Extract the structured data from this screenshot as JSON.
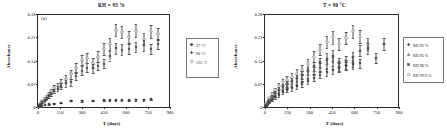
{
  "figure": {
    "panel_label": "(b)",
    "axis_x_label": "T (days)",
    "axis_y_label": "Absorbance"
  },
  "chart_data": [
    {
      "type": "scatter",
      "panel": "(b)",
      "title": "RH = 95 %",
      "xlabel": "T (days)",
      "ylabel": "Absorbance",
      "xlim": [
        0,
        900
      ],
      "ylim": [
        0,
        0.28
      ],
      "xticks": [
        0,
        150,
        300,
        450,
        600,
        750,
        900
      ],
      "yticks": [
        0,
        0.07,
        0.14,
        0.21,
        0.28
      ],
      "xtick_labels": [
        "0",
        "150",
        "300",
        "450",
        "600",
        "750",
        "900"
      ],
      "ytick_labels": [
        "0",
        "0.07",
        "0.14",
        "0.21",
        "0.28"
      ],
      "grid": false,
      "legend_position": "right-outside",
      "error_bars": true,
      "series": [
        {
          "name": "125 °C",
          "marker": "open-circle",
          "color": "#8d8d8d",
          "x": [
            7,
            15,
            22,
            30,
            45,
            60,
            75,
            90,
            110,
            135,
            160,
            190,
            225,
            260,
            300,
            335,
            375,
            410,
            450,
            490,
            530,
            570,
            620,
            665,
            720,
            770,
            820
          ],
          "y": [
            0.004,
            0.008,
            0.012,
            0.017,
            0.024,
            0.031,
            0.039,
            0.047,
            0.056,
            0.063,
            0.072,
            0.084,
            0.098,
            0.118,
            0.142,
            0.147,
            0.133,
            0.152,
            0.175,
            0.19,
            0.232,
            0.226,
            0.212,
            0.23,
            0.206,
            0.228,
            0.219
          ],
          "yerr": [
            0.002,
            0.003,
            0.003,
            0.004,
            0.005,
            0.006,
            0.007,
            0.008,
            0.009,
            0.01,
            0.011,
            0.013,
            0.014,
            0.015,
            0.016,
            0.016,
            0.015,
            0.016,
            0.017,
            0.018,
            0.019,
            0.019,
            0.018,
            0.019,
            0.018,
            0.019,
            0.018
          ]
        },
        {
          "name": "90 °C",
          "marker": "filled-diamond",
          "color": "#4a4a4a",
          "x": [
            7,
            15,
            22,
            30,
            45,
            60,
            75,
            90,
            110,
            135,
            160,
            190,
            225,
            260,
            300,
            335,
            375,
            410,
            450,
            490,
            530,
            570,
            620,
            665,
            720,
            770,
            820
          ],
          "y": [
            0.003,
            0.006,
            0.01,
            0.014,
            0.02,
            0.026,
            0.033,
            0.04,
            0.048,
            0.055,
            0.062,
            0.071,
            0.074,
            0.093,
            0.109,
            0.118,
            0.116,
            0.123,
            0.13,
            0.155,
            0.177,
            0.173,
            0.175,
            0.181,
            0.186,
            0.175,
            0.19
          ],
          "yerr": [
            0.002,
            0.002,
            0.003,
            0.003,
            0.004,
            0.005,
            0.006,
            0.006,
            0.007,
            0.008,
            0.009,
            0.01,
            0.01,
            0.012,
            0.013,
            0.013,
            0.013,
            0.013,
            0.014,
            0.015,
            0.016,
            0.016,
            0.016,
            0.016,
            0.016,
            0.016,
            0.016
          ]
        },
        {
          "name": "37 °C",
          "marker": "filled-circle",
          "color": "#3a3a3a",
          "x": [
            7,
            22,
            45,
            75,
            110,
            160,
            225,
            300,
            375,
            450,
            490,
            530,
            570,
            620,
            665,
            720,
            770
          ],
          "y": [
            0.002,
            0.004,
            0.006,
            0.008,
            0.01,
            0.012,
            0.019,
            0.018,
            0.019,
            0.02,
            0.02,
            0.02,
            0.02,
            0.02,
            0.021,
            0.021,
            0.023
          ],
          "yerr": [
            0.001,
            0.001,
            0.001,
            0.001,
            0.001,
            0.001,
            0.002,
            0.002,
            0.002,
            0.002,
            0.002,
            0.002,
            0.002,
            0.002,
            0.002,
            0.002,
            0.002
          ]
        }
      ],
      "legend": [
        {
          "label": "37 °C",
          "marker": "filled-circle",
          "color": "#3a3a3a"
        },
        {
          "label": "90 °C",
          "marker": "filled-diamond",
          "color": "#4a4a4a"
        },
        {
          "label": "125 °C",
          "marker": "open-circle",
          "color": "#8d8d8d"
        }
      ]
    },
    {
      "type": "scatter",
      "panel": "",
      "title": "T = 90 °C",
      "xlabel": "T (days)",
      "ylabel": "Absorbance",
      "xlim": [
        0,
        900
      ],
      "ylim": [
        0,
        0.28
      ],
      "xticks": [
        0,
        150,
        300,
        450,
        600,
        750,
        900
      ],
      "yticks": [
        0,
        0.07,
        0.14,
        0.21,
        0.28
      ],
      "xtick_labels": [
        "0",
        "150",
        "300",
        "450",
        "600",
        "750",
        "900"
      ],
      "ytick_labels": [
        "0",
        "0.07",
        "0.14",
        "0.21",
        "0.28"
      ],
      "grid": false,
      "legend_position": "right-outside",
      "error_bars": true,
      "series": [
        {
          "name": "RH 99.9 %",
          "marker": "open-circle",
          "color": "#9a9a9a",
          "x": [
            8,
            18,
            30,
            48,
            68,
            92,
            118,
            148,
            180,
            212,
            248,
            288,
            330,
            372,
            415,
            455,
            500,
            545,
            590,
            640,
            690
          ],
          "y": [
            0.008,
            0.016,
            0.026,
            0.038,
            0.05,
            0.062,
            0.074,
            0.082,
            0.09,
            0.1,
            0.112,
            0.13,
            0.152,
            0.173,
            0.196,
            0.21,
            0.19,
            0.208,
            0.228,
            0.212,
            0.19
          ],
          "yerr": [
            0.003,
            0.004,
            0.005,
            0.006,
            0.008,
            0.009,
            0.01,
            0.011,
            0.012,
            0.013,
            0.014,
            0.015,
            0.016,
            0.017,
            0.018,
            0.019,
            0.018,
            0.019,
            0.02,
            0.019,
            0.018
          ]
        },
        {
          "name": "RH 98 %",
          "marker": "filled-square",
          "color": "#5a5a5a",
          "x": [
            8,
            18,
            30,
            48,
            68,
            92,
            118,
            148,
            180,
            212,
            248,
            288,
            330,
            372,
            415,
            455,
            500,
            545,
            590,
            640,
            690,
            745,
            800
          ],
          "y": [
            0.006,
            0.013,
            0.021,
            0.031,
            0.042,
            0.052,
            0.062,
            0.07,
            0.078,
            0.086,
            0.096,
            0.108,
            0.122,
            0.134,
            0.146,
            0.155,
            0.134,
            0.14,
            0.15,
            0.17,
            0.178,
            0.148,
            0.19
          ],
          "yerr": [
            0.002,
            0.003,
            0.004,
            0.005,
            0.006,
            0.007,
            0.008,
            0.009,
            0.01,
            0.011,
            0.012,
            0.013,
            0.014,
            0.015,
            0.016,
            0.016,
            0.015,
            0.015,
            0.016,
            0.017,
            0.017,
            0.016,
            0.018
          ]
        },
        {
          "name": "RH 95 %",
          "marker": "filled-triangle",
          "color": "#6a6a6a",
          "x": [
            8,
            18,
            30,
            48,
            68,
            92,
            118,
            148,
            180,
            212,
            248,
            288,
            330,
            372,
            415,
            455,
            500,
            545,
            590
          ],
          "y": [
            0.005,
            0.011,
            0.018,
            0.027,
            0.036,
            0.045,
            0.054,
            0.062,
            0.069,
            0.077,
            0.086,
            0.096,
            0.108,
            0.118,
            0.128,
            0.136,
            0.122,
            0.128,
            0.136
          ],
          "yerr": [
            0.002,
            0.003,
            0.003,
            0.004,
            0.005,
            0.006,
            0.007,
            0.008,
            0.009,
            0.01,
            0.011,
            0.012,
            0.013,
            0.013,
            0.014,
            0.014,
            0.014,
            0.014,
            0.015
          ]
        },
        {
          "name": "RH 92 %",
          "marker": "filled-diamond",
          "color": "#3f3f3f",
          "x": [
            8,
            18,
            30,
            48,
            68,
            92,
            118,
            148,
            180,
            212,
            248,
            288,
            330,
            372,
            415,
            455,
            500,
            545,
            590,
            640
          ],
          "y": [
            0.004,
            0.009,
            0.015,
            0.022,
            0.029,
            0.036,
            0.044,
            0.05,
            0.056,
            0.062,
            0.07,
            0.078,
            0.088,
            0.097,
            0.105,
            0.112,
            0.118,
            0.123,
            0.128,
            0.132
          ],
          "yerr": [
            0.002,
            0.002,
            0.003,
            0.003,
            0.004,
            0.005,
            0.006,
            0.006,
            0.007,
            0.008,
            0.009,
            0.01,
            0.011,
            0.011,
            0.012,
            0.012,
            0.013,
            0.013,
            0.013,
            0.014
          ]
        }
      ],
      "legend": [
        {
          "label": "RH 92 %",
          "marker": "filled-diamond",
          "color": "#3f3f3f"
        },
        {
          "label": "RH 95 %",
          "marker": "filled-triangle",
          "color": "#6a6a6a"
        },
        {
          "label": "RH 98 %",
          "marker": "filled-square",
          "color": "#5a5a5a"
        },
        {
          "label": "RH 99.9 %",
          "marker": "open-circle",
          "color": "#9a9a9a"
        }
      ]
    }
  ]
}
